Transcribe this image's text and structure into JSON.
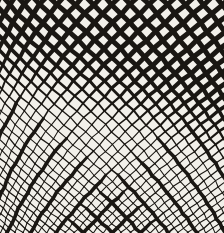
{
  "artwork": {
    "name": "diamond-mesh-op-art",
    "description": "Abstract black-and-white op-art pattern: a warped chain-link diamond lattice, bold and large-celled at the top, shrinking to a fine thin mesh at the bottom, with compressed columns at the left edge and sparse thick diagonal accent bands crossing in the lower half.",
    "canvas": {
      "width": 224,
      "height": 233
    },
    "colors": {
      "background": "#f2f0ea",
      "ink": "#1a1713"
    },
    "mesh": {
      "center_x": 112,
      "half_pitch_top": 9.3,
      "half_pitch_bottom": 4.6,
      "half_width_top": 9.3,
      "half_width_bottom": 4.7,
      "left_warp_edge": 70,
      "left_warp_k": 0.0017,
      "stroke_max": 5.0,
      "stroke_min": 1.05,
      "fade_start": 35,
      "fade_span": 105,
      "fade_left_bias": 0.22,
      "fade_right_bias": 0.32,
      "accent_period": 3,
      "accent_threshold_base": 65,
      "accent_threshold_slope": 0.92,
      "accent_fade_span": 30,
      "accent_min": 1.3,
      "accent_gain": 2.3,
      "jitter": 0.55,
      "d_min": -40,
      "d_max": 30,
      "margin": 16
    }
  }
}
